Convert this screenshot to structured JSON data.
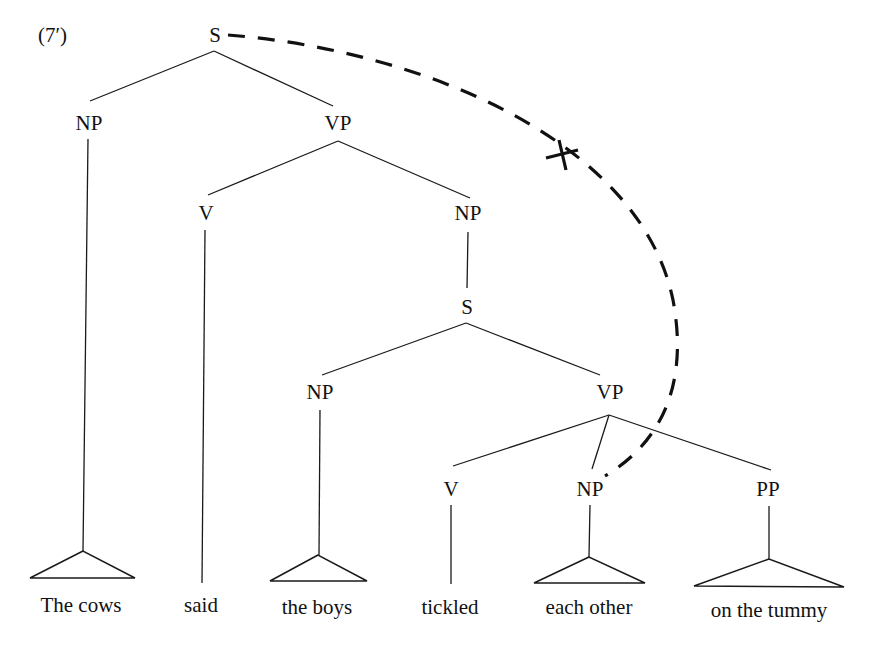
{
  "example_label": "(7′)",
  "nodes": {
    "s_root": "S",
    "np_subject": "NP",
    "vp_main": "VP",
    "v_main": "V",
    "np_complement": "NP",
    "s_embedded": "S",
    "np_embedded_subject": "NP",
    "vp_embedded": "VP",
    "v_embedded": "V",
    "np_object": "NP",
    "pp_adjunct": "PP"
  },
  "words": {
    "the_cows": "The cows",
    "said": "said",
    "the_boys": "the boys",
    "tickled": "tickled",
    "each_other": "each other",
    "on_the_tummy": "on the tummy"
  },
  "binding_arc": {
    "from": "S",
    "to": "NP (each other)",
    "style": "dashed",
    "marker": "✕ (blocked)"
  }
}
